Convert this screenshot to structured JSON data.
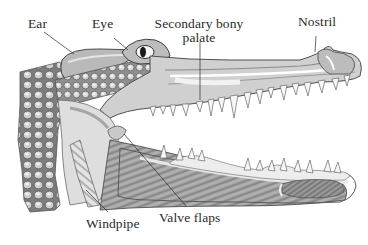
{
  "diagram": {
    "colors": {
      "background": "#ffffff",
      "ink": "#2a2a2a",
      "skin_dark": "#7a7a7a",
      "skin_mid": "#a9a9a9",
      "skin_light": "#d6d6d6",
      "tissue_light": "#e8e8e8",
      "muscle": "#8c8c8c"
    },
    "labels": [
      {
        "id": "ear",
        "text": "Ear"
      },
      {
        "id": "eye",
        "text": "Eye"
      },
      {
        "id": "secondary-bony-palate",
        "line1": "Secondary bony",
        "line2": "palate"
      },
      {
        "id": "nostril",
        "text": "Nostril"
      },
      {
        "id": "windpipe",
        "text": "Windpipe"
      },
      {
        "id": "valve-flaps",
        "text": "Valve flaps"
      }
    ]
  }
}
